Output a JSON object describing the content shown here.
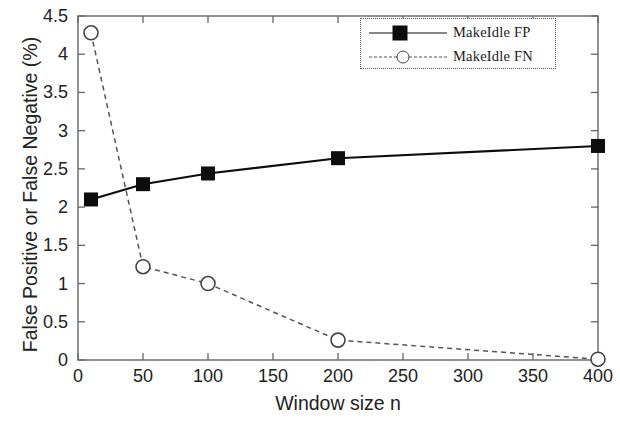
{
  "chart_data": {
    "type": "line",
    "title": "",
    "xlabel": "Window size n",
    "ylabel": "False Positive or False Negative (%)",
    "xlim": [
      0,
      400
    ],
    "ylim": [
      0,
      4.5
    ],
    "grid": false,
    "legend_position": "top-right",
    "x_ticks": [
      0,
      50,
      100,
      150,
      200,
      250,
      300,
      350,
      400
    ],
    "x_tick_labels": [
      "0",
      "50",
      "100",
      "150",
      "200",
      "250",
      "300",
      "350",
      "400"
    ],
    "y_ticks": [
      0,
      0.5,
      1,
      1.5,
      2,
      2.5,
      3,
      3.5,
      4,
      4.5
    ],
    "y_tick_labels": [
      "0",
      "0.5",
      "1",
      "1.5",
      "2",
      "2.5",
      "3",
      "3.5",
      "4",
      "4.5"
    ],
    "x": [
      10,
      50,
      100,
      200,
      400
    ],
    "series": [
      {
        "name": "MakeIdle FP",
        "marker": "filled-square",
        "line_style": "solid",
        "color": "#0d0d0d",
        "values": [
          2.1,
          2.3,
          2.44,
          2.64,
          2.8
        ]
      },
      {
        "name": "MakeIdle FN",
        "marker": "open-circle",
        "line_style": "dashed",
        "color": "#444444",
        "values": [
          4.28,
          1.22,
          1.0,
          0.26,
          0.01
        ]
      }
    ]
  },
  "legend": {
    "items": [
      {
        "label": "MakeIdle FP"
      },
      {
        "label": "MakeIdle FN"
      }
    ]
  },
  "axes": {
    "x_title": "Window size n",
    "y_title": "False Positive or False Negative (%)"
  }
}
